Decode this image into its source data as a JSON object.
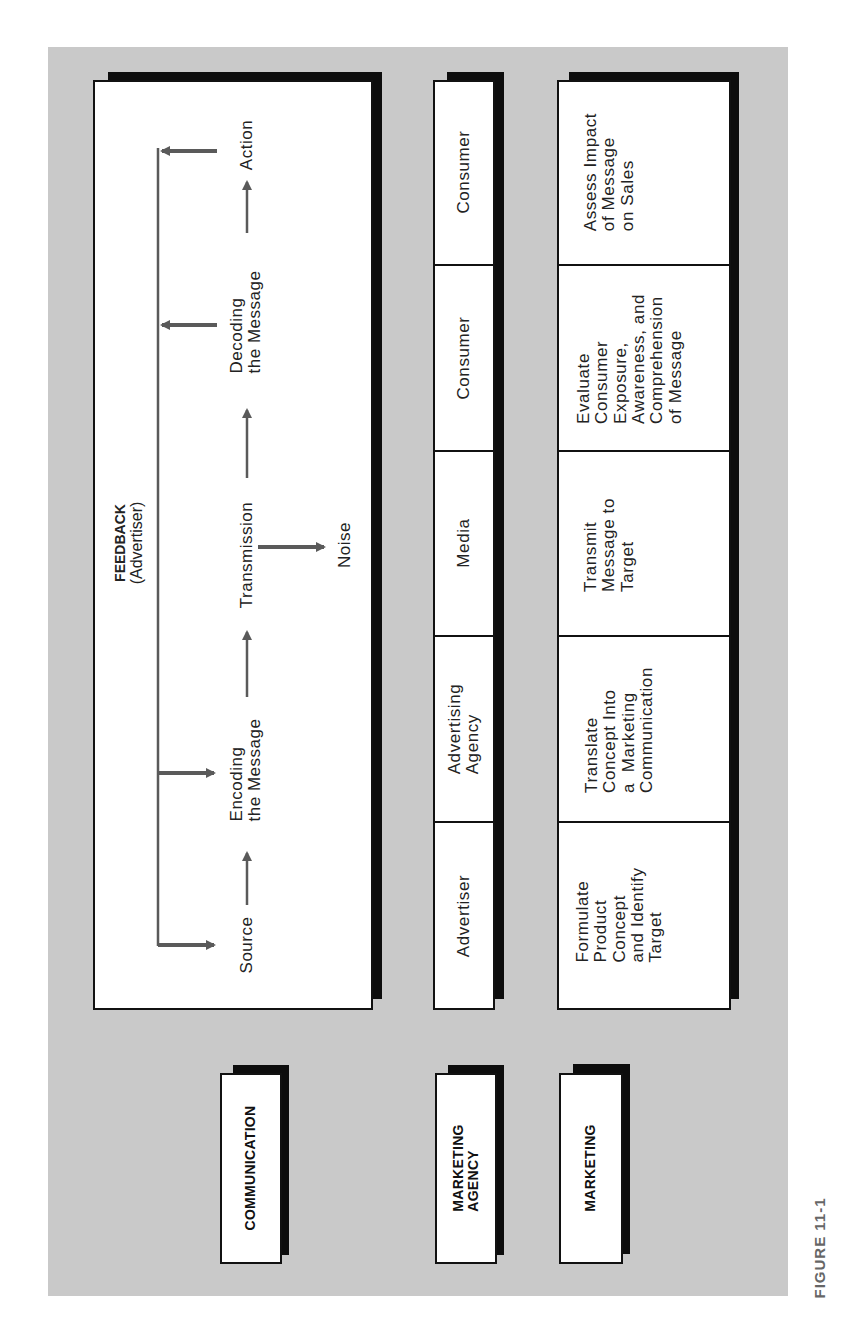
{
  "figure_caption": "FIGURE 11-1",
  "colors": {
    "panel_bg": "#c9c9c9",
    "box_bg": "#ffffff",
    "shadow": "#0d0d0d",
    "arrow": "#5a5a5a"
  },
  "rows": {
    "communication": {
      "label": "COMMUNICATION",
      "feedback_title": "FEEDBACK",
      "feedback_subtitle": "(Advertiser)",
      "flow": [
        {
          "id": "source",
          "text": "Source"
        },
        {
          "id": "encoding",
          "text": "Encoding\nthe Message"
        },
        {
          "id": "transmission",
          "text": "Transmission"
        },
        {
          "id": "decoding",
          "text": "Decoding\nthe Message"
        },
        {
          "id": "action",
          "text": "Action"
        }
      ],
      "noise": "Noise"
    },
    "marketing_agency": {
      "label": "MARKETING\nAGENCY",
      "cells": [
        "Advertiser",
        "Advertising\nAgency",
        "Media",
        "Consumer",
        "Consumer"
      ]
    },
    "marketing": {
      "label": "MARKETING",
      "cells": [
        "Formulate\nProduct\nConcept\nand Identify\nTarget",
        "Translate\nConcept Into\na  Marketing\nCommunication",
        "Transmit\nMessage to\nTarget",
        "Evaluate\nConsumer\nExposure,\nAwareness, and\nComprehension\nof Message",
        "Assess Impact\nof Message\non Sales"
      ]
    }
  }
}
